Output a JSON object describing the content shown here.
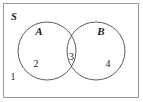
{
  "figure": {
    "kind": "venn-diagram",
    "background_color": "#fdfdfc",
    "stroke_color": "#4a4a4a",
    "text_color": "#1a1a1a"
  },
  "universal_set": {
    "label": "S",
    "label_x": 11,
    "label_y": 20,
    "rect": {
      "x": 3.5,
      "y": 3.5,
      "width": 135,
      "height": 94
    }
  },
  "sets": [
    {
      "id": "set-a",
      "label": "A",
      "label_x": 39,
      "label_y": 35,
      "cx": 47,
      "cy": 51,
      "r": 29
    },
    {
      "id": "set-b",
      "label": "B",
      "label_x": 101,
      "label_y": 35,
      "cx": 96,
      "cy": 51,
      "r": 29
    }
  ],
  "regions": [
    {
      "id": "region-outside",
      "name": "outside-both-sets",
      "label": "1",
      "x": 13,
      "y": 80
    },
    {
      "id": "region-a-only",
      "name": "a-only",
      "label": "2",
      "x": 36,
      "y": 67
    },
    {
      "id": "region-intersection",
      "name": "a-intersect-b",
      "label": "3",
      "x": 71.5,
      "y": 60
    },
    {
      "id": "region-b-only",
      "name": "b-only",
      "label": "4",
      "x": 108,
      "y": 67
    }
  ],
  "typography": {
    "set_label_size": "11px",
    "number_size": "10px",
    "universal_label_size": "10px"
  }
}
